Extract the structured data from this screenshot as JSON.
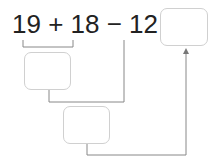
{
  "equation": {
    "text": "19 + 18 − 12 =",
    "terms": [
      "19",
      "+",
      "18",
      "−",
      "12",
      "="
    ]
  },
  "boxes": {
    "result": "",
    "step1": "",
    "step2": ""
  },
  "colors": {
    "text": "#222222",
    "box_border": "#d0d0d0",
    "line": "#888888"
  }
}
